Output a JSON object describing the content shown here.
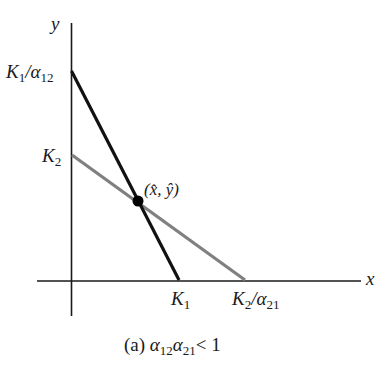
{
  "diagram": {
    "type": "phase-plane",
    "colors": {
      "axis": "#1a1a1a",
      "line_1": "#111111",
      "line_2": "#808080",
      "equilibrium_point": "#000000"
    },
    "axes": {
      "x_label": "x",
      "y_label": "y"
    },
    "y_intercepts": {
      "line_1": {
        "main": "K",
        "sub_main": "1",
        "sep": "/",
        "greek": "α",
        "sub_greek": "12"
      },
      "line_2": {
        "main": "K",
        "sub_main": "2"
      }
    },
    "x_intercepts": {
      "line_1": {
        "main": "K",
        "sub_main": "1"
      },
      "line_2": {
        "main": "K",
        "sub_main": "2",
        "sep": "/",
        "greek": "α",
        "sub_greek": "21"
      }
    },
    "equilibrium": {
      "label": "(x̂, ŷ)"
    },
    "caption": {
      "prefix": "(a)",
      "greek_a": "α",
      "sub_a": "12",
      "greek_b": "α",
      "sub_b": "21",
      "relation": "< 1"
    }
  }
}
